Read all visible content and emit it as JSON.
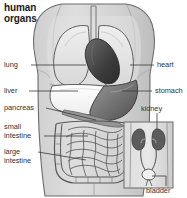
{
  "figure": {
    "title": "human\norgans",
    "width": 187,
    "height": 198,
    "kind": "anatomical-illustration",
    "background_color": "#ffffff",
    "body_fill": "#d9d9d9",
    "outline_color": "#4d4d4d",
    "inset_note": "urinary system inset panel at lower right"
  },
  "labels": {
    "lung": "lung",
    "liver": "liver",
    "pancreas": "pancreas",
    "small_intestine": "small\nintestine",
    "large_intestine": "large\nintestine",
    "heart": "heart",
    "stomach": "stomach",
    "kidney": "kidney",
    "bladder": "bladder"
  },
  "organs": [
    {
      "name": "lung",
      "side": "left",
      "fill": "#e8e8e8"
    },
    {
      "name": "heart",
      "side": "right",
      "fill": "#4a4a4a"
    },
    {
      "name": "liver",
      "side": "left",
      "fill": "#fbfbfb"
    },
    {
      "name": "stomach",
      "side": "right",
      "fill": "#6e6e6e"
    },
    {
      "name": "pancreas",
      "side": "left",
      "fill": "#8f8f8f"
    },
    {
      "name": "small-intestine",
      "side": "left",
      "fill": "#e4e4e4"
    },
    {
      "name": "large-intestine",
      "side": "left",
      "fill": "#dadada"
    },
    {
      "name": "kidney",
      "side": "right",
      "fill": "#595959"
    },
    {
      "name": "bladder",
      "side": "right",
      "fill": "#f2f2f2"
    }
  ]
}
